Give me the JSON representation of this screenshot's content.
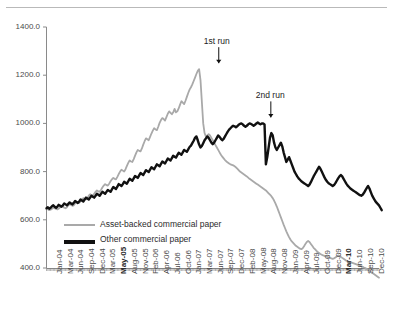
{
  "chart_data": {
    "type": "line",
    "title": "",
    "xlabel": "",
    "ylabel": "",
    "ylim": [
      400.0,
      1400.0
    ],
    "yticks": [
      "1400.0",
      "1200.0",
      "1000.0",
      "800.0",
      "600.0",
      "400.0"
    ],
    "ytick_values": [
      1400,
      1200,
      1000,
      800,
      600,
      400
    ],
    "grid": false,
    "legend_position": "bottom-left",
    "annotations": [
      {
        "text": "1st run",
        "x": "Aug-07",
        "y": 1225,
        "marker": "down-arrow"
      },
      {
        "text": "2nd run",
        "x": "Sep-08",
        "y": 1000,
        "marker": "down-arrow"
      }
    ],
    "xticks": [
      "Jan-04",
      "Mar-04",
      "Jun-04",
      "Sep-04",
      "Dec-04",
      "Mar-05",
      "May-05",
      "Aug-05",
      "Nov-05",
      "Feb-06",
      "Apr-06",
      "Jul-06",
      "Oct-06",
      "Jan-07",
      "Mar-07",
      "Jun-07",
      "Sep-07",
      "Dec-07",
      "Feb-08",
      "May-08",
      "Aug-08",
      "Nov-08",
      "Jan-09",
      "Apr-09",
      "Jul-09",
      "Oct-09",
      "Dec-09",
      "Mar-10",
      "Jun-10",
      "Sep-10",
      "Dec-10"
    ],
    "xticks_bold": [
      "May-05",
      "Mar-10"
    ],
    "series": [
      {
        "name": "Asset-backed commercial paper",
        "color": "#a9a9a9",
        "width": 1.8,
        "values": [
          645,
          644,
          640,
          642,
          646,
          650,
          648,
          645,
          643,
          647,
          652,
          658,
          655,
          650,
          648,
          652,
          660,
          665,
          662,
          658,
          660,
          668,
          675,
          672,
          670,
          676,
          684,
          690,
          688,
          685,
          690,
          700,
          706,
          702,
          700,
          708,
          716,
          722,
          718,
          716,
          724,
          734,
          742,
          748,
          744,
          742,
          750,
          760,
          768,
          774,
          770,
          768,
          778,
          790,
          800,
          808,
          804,
          800,
          810,
          824,
          836,
          846,
          842,
          840,
          852,
          866,
          880,
          890,
          886,
          884,
          896,
          912,
          926,
          938,
          934,
          930,
          944,
          958,
          970,
          980,
          975,
          972,
          986,
          1002,
          1014,
          1022,
          1018,
          1012,
          1026,
          1040,
          1050,
          1044,
          1038,
          1046,
          1060,
          1046,
          1050,
          1062,
          1078,
          1092,
          1086,
          1080,
          1094,
          1110,
          1126,
          1140,
          1150,
          1162,
          1176,
          1190,
          1205,
          1218,
          1225,
          1180,
          1090,
          1000,
          960,
          945,
          950,
          955,
          950,
          940,
          930,
          920,
          910,
          900,
          890,
          880,
          870,
          862,
          855,
          848,
          842,
          838,
          834,
          830,
          828,
          826,
          822,
          818,
          812,
          806,
          800,
          796,
          792,
          788,
          784,
          780,
          775,
          770,
          766,
          762,
          758,
          754,
          750,
          746,
          742,
          738,
          734,
          730,
          726,
          722,
          716,
          710,
          704,
          698,
          690,
          680,
          668,
          655,
          640,
          625,
          610,
          595,
          580,
          566,
          552,
          540,
          528,
          518,
          510,
          504,
          498,
          492,
          488,
          484,
          480,
          478,
          482,
          490,
          500,
          508,
          512,
          508,
          500,
          492,
          484,
          478,
          472,
          466,
          462,
          458,
          455,
          452,
          450,
          448,
          446,
          444,
          442,
          440,
          438,
          440,
          444,
          448,
          452,
          450,
          446,
          442,
          438,
          434,
          430,
          428,
          426,
          424,
          422,
          420,
          418,
          416,
          414,
          412,
          410,
          408,
          405,
          402,
          400,
          396,
          392,
          388,
          384,
          380,
          376,
          372,
          368,
          364,
          360
        ]
      },
      {
        "name": "Other commercial paper",
        "color": "#111111",
        "width": 2.4,
        "values": [
          648,
          652,
          646,
          650,
          656,
          660,
          654,
          650,
          655,
          662,
          658,
          654,
          660,
          668,
          664,
          660,
          666,
          672,
          668,
          664,
          670,
          678,
          674,
          670,
          676,
          684,
          680,
          676,
          684,
          692,
          688,
          684,
          692,
          700,
          696,
          692,
          700,
          708,
          704,
          700,
          708,
          716,
          712,
          708,
          716,
          724,
          720,
          716,
          726,
          736,
          732,
          728,
          738,
          748,
          744,
          740,
          748,
          758,
          754,
          750,
          760,
          770,
          766,
          762,
          772,
          782,
          778,
          774,
          784,
          794,
          790,
          786,
          796,
          806,
          802,
          798,
          808,
          818,
          814,
          810,
          820,
          830,
          826,
          822,
          832,
          842,
          838,
          834,
          844,
          854,
          850,
          846,
          856,
          866,
          862,
          858,
          868,
          878,
          874,
          870,
          880,
          890,
          886,
          882,
          892,
          902,
          908,
          918,
          928,
          940,
          946,
          930,
          912,
          900,
          906,
          918,
          930,
          938,
          946,
          940,
          930,
          920,
          914,
          920,
          930,
          940,
          950,
          944,
          936,
          930,
          936,
          946,
          956,
          966,
          974,
          980,
          986,
          990,
          988,
          984,
          988,
          994,
          998,
          1000,
          996,
          990,
          986,
          990,
          996,
          1000,
          998,
          994,
          990,
          994,
          1000,
          1004,
          1000,
          996,
          1000,
          1000,
          996,
          830,
          860,
          900,
          940,
          960,
          950,
          920,
          900,
          890,
          900,
          910,
          920,
          905,
          880,
          860,
          840,
          850,
          860,
          845,
          830,
          815,
          800,
          790,
          780,
          772,
          766,
          760,
          756,
          752,
          748,
          744,
          740,
          746,
          756,
          768,
          780,
          790,
          800,
          810,
          820,
          812,
          800,
          788,
          776,
          766,
          758,
          752,
          748,
          744,
          740,
          744,
          752,
          762,
          772,
          780,
          786,
          780,
          770,
          760,
          750,
          742,
          736,
          730,
          726,
          722,
          718,
          714,
          710,
          706,
          702,
          700,
          704,
          712,
          722,
          732,
          740,
          730,
          715,
          700,
          690,
          680,
          672,
          666,
          660,
          650,
          640
        ]
      }
    ]
  },
  "legend": {
    "items": [
      {
        "label": "Asset-backed commercial paper"
      },
      {
        "label": "Other commercial paper"
      }
    ]
  }
}
